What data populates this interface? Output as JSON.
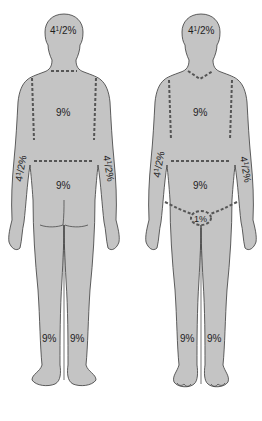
{
  "diagram": {
    "type": "rule-of-nines body surface area chart",
    "colors": {
      "body_fill": "#c4c4c4",
      "outline": "#3a3a3a",
      "dashed_divider": "#555555",
      "text": "#1e1e1e",
      "background": "#ffffff"
    },
    "figures": [
      {
        "view": "posterior",
        "labels": {
          "head": {
            "whole": "4",
            "sup": "1",
            "frac": "/2%"
          },
          "upper_trunk": "9%",
          "left_arm": {
            "whole": "4",
            "sup": "1",
            "frac": "/2%"
          },
          "right_arm": {
            "whole": "4",
            "sup": "1",
            "frac": "/2%"
          },
          "lower_trunk": "9%",
          "left_leg": "9%",
          "right_leg": "9%"
        }
      },
      {
        "view": "anterior",
        "labels": {
          "head": {
            "whole": "4",
            "sup": "1",
            "frac": "/2%"
          },
          "upper_trunk": "9%",
          "left_arm": {
            "whole": "4",
            "sup": "1",
            "frac": "/2%"
          },
          "right_arm": {
            "whole": "4",
            "sup": "1",
            "frac": "/2%"
          },
          "lower_trunk": "9%",
          "genitals": "1%",
          "left_leg": "9%",
          "right_leg": "9%"
        }
      }
    ]
  }
}
